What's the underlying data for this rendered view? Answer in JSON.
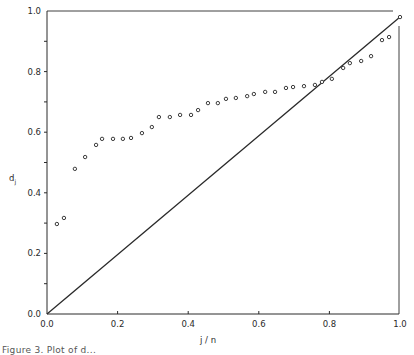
{
  "chart_data": {
    "type": "scatter",
    "title": "",
    "xlabel": "j / n",
    "ylabel": "d_j",
    "ylabel_main": "d",
    "ylabel_sub": "j",
    "xlim": [
      0.0,
      1.0
    ],
    "ylim": [
      0.0,
      1.0
    ],
    "grid": false,
    "legend": null,
    "x_ticks": [
      "0.0",
      "0.2",
      "0.4",
      "0.6",
      "0.8",
      "1.0"
    ],
    "y_ticks": [
      "0.0",
      "0.2",
      "0.4",
      "0.6",
      "0.8",
      "1.0"
    ],
    "reference_line": {
      "type": "line",
      "from": [
        0.0,
        0.0
      ],
      "to": [
        1.0,
        0.98
      ],
      "label": "diagonal"
    },
    "series": [
      {
        "name": "d_j",
        "marker": "open-circle",
        "points": [
          [
            0.028,
            0.297
          ],
          [
            0.048,
            0.317
          ],
          [
            0.079,
            0.479
          ],
          [
            0.108,
            0.518
          ],
          [
            0.139,
            0.558
          ],
          [
            0.156,
            0.578
          ],
          [
            0.187,
            0.578
          ],
          [
            0.215,
            0.578
          ],
          [
            0.238,
            0.581
          ],
          [
            0.269,
            0.597
          ],
          [
            0.297,
            0.617
          ],
          [
            0.317,
            0.65
          ],
          [
            0.348,
            0.65
          ],
          [
            0.377,
            0.657
          ],
          [
            0.408,
            0.657
          ],
          [
            0.428,
            0.673
          ],
          [
            0.456,
            0.696
          ],
          [
            0.484,
            0.696
          ],
          [
            0.507,
            0.71
          ],
          [
            0.535,
            0.713
          ],
          [
            0.567,
            0.719
          ],
          [
            0.586,
            0.726
          ],
          [
            0.618,
            0.733
          ],
          [
            0.646,
            0.733
          ],
          [
            0.677,
            0.746
          ],
          [
            0.697,
            0.749
          ],
          [
            0.728,
            0.752
          ],
          [
            0.759,
            0.756
          ],
          [
            0.779,
            0.766
          ],
          [
            0.807,
            0.776
          ],
          [
            0.839,
            0.812
          ],
          [
            0.858,
            0.828
          ],
          [
            0.89,
            0.835
          ],
          [
            0.918,
            0.851
          ],
          [
            0.949,
            0.904
          ],
          [
            0.969,
            0.914
          ],
          [
            1.0,
            0.98
          ]
        ]
      }
    ],
    "caption": "Figure 3. Plot of d..."
  },
  "colors": {
    "ink": "#2a2a2a",
    "marker": "#3a3a3a",
    "background": "#ffffff"
  }
}
